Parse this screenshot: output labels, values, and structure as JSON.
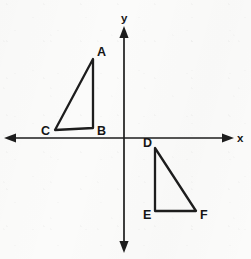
{
  "figure": {
    "width": 251,
    "height": 259,
    "background_color": "#fbfbfa",
    "ink_color": "#1d1d1d"
  },
  "axes": {
    "x_axis": {
      "label": "x",
      "label_position": {
        "x": 237,
        "y": 142
      },
      "line": {
        "x1": 10,
        "y1": 138,
        "x2": 228,
        "y2": 138
      },
      "arrow_left": true,
      "arrow_right": true
    },
    "y_axis": {
      "label": "y",
      "label_position": {
        "x": 121,
        "y": 22
      },
      "line": {
        "x1": 124,
        "y1": 30,
        "x2": 124,
        "y2": 249
      },
      "arrow_up": true,
      "arrow_down": true
    },
    "origin": {
      "x": 124,
      "y": 138
    }
  },
  "shapes": [
    {
      "name": "triangle-abc",
      "kind": "right-triangle",
      "quadrant": "II",
      "vertices": [
        {
          "label": "A",
          "x": 93,
          "y": 59,
          "label_x": 97,
          "label_y": 56
        },
        {
          "label": "B",
          "x": 93,
          "y": 128,
          "label_x": 97,
          "label_y": 135
        },
        {
          "label": "C",
          "x": 55,
          "y": 130,
          "label_x": 41,
          "label_y": 135
        }
      ],
      "path": "M93,59 L93,128 L55,130 Z"
    },
    {
      "name": "triangle-def",
      "kind": "right-triangle",
      "quadrant": "IV",
      "vertices": [
        {
          "label": "D",
          "x": 155,
          "y": 148,
          "label_x": 143,
          "label_y": 147
        },
        {
          "label": "E",
          "x": 155,
          "y": 211,
          "label_x": 143,
          "label_y": 219
        },
        {
          "label": "F",
          "x": 196,
          "y": 211,
          "label_x": 200,
          "label_y": 219
        }
      ],
      "path": "M155,148 L155,211 L196,211 Z"
    }
  ],
  "labels": {
    "vertex_a": "A",
    "vertex_b": "B",
    "vertex_c": "C",
    "vertex_d": "D",
    "vertex_e": "E",
    "vertex_f": "F",
    "axis_x": "x",
    "axis_y": "y"
  }
}
